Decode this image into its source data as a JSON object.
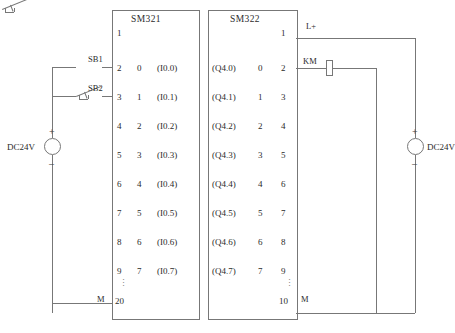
{
  "diagram": {
    "line_color": "#777777"
  },
  "input_module": {
    "name": "SM321",
    "top_terminal": "1",
    "bottom_terminal": "20",
    "ellipsis": "⋮",
    "ground_label": "M",
    "rows": [
      {
        "terminal": "2",
        "channel": "0",
        "address": "(I0.0)"
      },
      {
        "terminal": "3",
        "channel": "1",
        "address": "(I0.1)"
      },
      {
        "terminal": "4",
        "channel": "2",
        "address": "(I0.2)"
      },
      {
        "terminal": "5",
        "channel": "3",
        "address": "(I0.3)"
      },
      {
        "terminal": "6",
        "channel": "4",
        "address": "(I0.4)"
      },
      {
        "terminal": "7",
        "channel": "5",
        "address": "(I0.5)"
      },
      {
        "terminal": "8",
        "channel": "6",
        "address": "(I0.6)"
      },
      {
        "terminal": "9",
        "channel": "7",
        "address": "(I0.7)"
      }
    ]
  },
  "output_module": {
    "name": "SM322",
    "top_terminal": "1",
    "bottom_terminal": "10",
    "ellipsis": "⋮",
    "ground_label": "M",
    "power_label": "L+",
    "rows": [
      {
        "address": "(Q4.0)",
        "channel": "0",
        "terminal": "2"
      },
      {
        "address": "(Q4.1)",
        "channel": "1",
        "terminal": "3"
      },
      {
        "address": "(Q4.2)",
        "channel": "2",
        "terminal": "4"
      },
      {
        "address": "(Q4.3)",
        "channel": "3",
        "terminal": "5"
      },
      {
        "address": "(Q4.4)",
        "channel": "4",
        "terminal": "6"
      },
      {
        "address": "(Q4.5)",
        "channel": "5",
        "terminal": "7"
      },
      {
        "address": "(Q4.6)",
        "channel": "6",
        "terminal": "8"
      },
      {
        "address": "(Q4.7)",
        "channel": "7",
        "terminal": "9"
      }
    ]
  },
  "switches": [
    {
      "name": "SB1"
    },
    {
      "name": "SB2"
    }
  ],
  "contactor": {
    "name": "KM"
  },
  "power_left": {
    "label": "DC24V",
    "plus": "+",
    "minus": "–"
  },
  "power_right": {
    "label": "DC24V",
    "plus": "+",
    "minus": "–"
  }
}
